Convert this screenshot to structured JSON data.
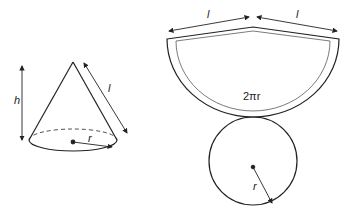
{
  "cone": {
    "height_label": "h",
    "slant_label": "l",
    "radius_label": "r"
  },
  "net": {
    "slant_left_label": "l",
    "slant_right_label": "l",
    "arc_label": "2πr",
    "circle_radius_label": "r"
  },
  "colors": {
    "stroke": "#222222",
    "background": "#ffffff"
  }
}
